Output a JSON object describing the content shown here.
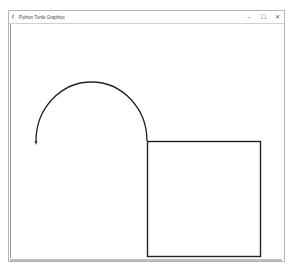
{
  "window": {
    "title": "Python Turtle Graphics",
    "app_icon": "turtle-feather-icon",
    "controls": {
      "minimize": "–",
      "maximize": "☐",
      "close": "✕"
    }
  },
  "drawing": {
    "stroke_color": "#222222",
    "shapes": [
      {
        "type": "semicircle-arc",
        "description": "upper half-circle drawn counter-clockwise ending with turtle pointing down"
      },
      {
        "type": "square",
        "description": "square drawn below-right of arc start"
      }
    ],
    "turtle": {
      "heading": "down",
      "color": "#333333"
    }
  }
}
